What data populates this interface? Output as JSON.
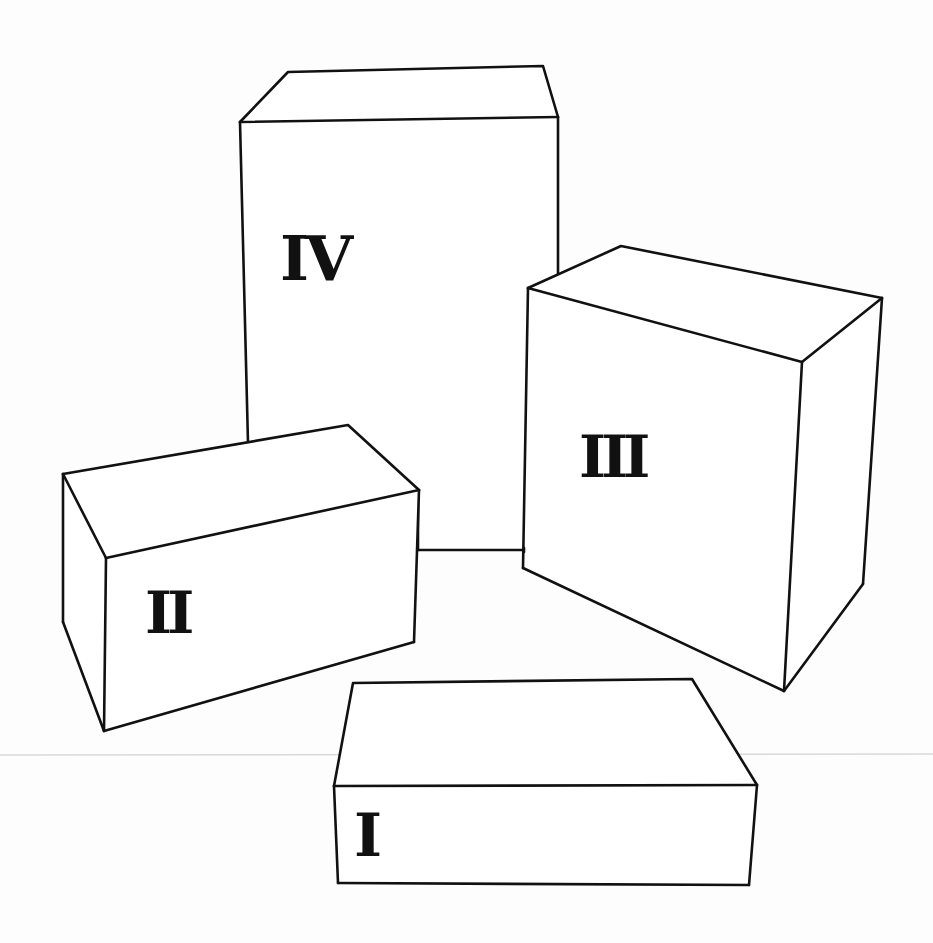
{
  "figure": {
    "background_color": "#ffffff",
    "line_color": "#111111",
    "boxes": [
      {
        "id": "box-1",
        "label": "I"
      },
      {
        "id": "box-2",
        "label": "II"
      },
      {
        "id": "box-3",
        "label": "III"
      },
      {
        "id": "box-4",
        "label": "IV"
      }
    ]
  }
}
